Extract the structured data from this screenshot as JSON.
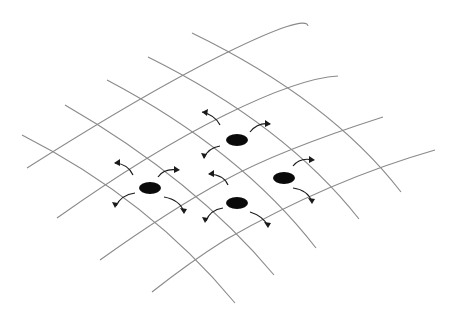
{
  "diagram": {
    "colors": {
      "background": "#ffffff",
      "grid": "#8a8a8a",
      "particle": "#0a0a0a",
      "arrow": "#1a1a1a"
    },
    "grid_rows": [
      {
        "d": "M27,168 Q150,90 228,52 T308,26"
      },
      {
        "d": "M57,218 Q150,152 225,115 T338,76"
      },
      {
        "d": "M100,260 Q170,210 225,180 T383,117"
      },
      {
        "d": "M152,292 Q190,262 225,240 Q330,180 435,150"
      }
    ],
    "grid_columns": [
      {
        "d": "M22,135 Q150,200 235,303"
      },
      {
        "d": "M65,105 Q195,180 274,275"
      },
      {
        "d": "M107,80 Q240,150 316,248"
      },
      {
        "d": "M148,57 Q285,125 359,219"
      },
      {
        "d": "M192,33 Q330,100 401,192"
      }
    ],
    "particles": [
      {
        "name": "particle-top",
        "cx": 237,
        "cy": 140,
        "rx": 11,
        "ry": 6
      },
      {
        "name": "particle-left",
        "cx": 150,
        "cy": 188,
        "rx": 11,
        "ry": 6
      },
      {
        "name": "particle-right",
        "cx": 284,
        "cy": 178,
        "rx": 11,
        "ry": 6
      },
      {
        "name": "particle-bottom",
        "cx": 237,
        "cy": 203,
        "rx": 11,
        "ry": 6
      }
    ],
    "arrows": [
      {
        "d": "M220,125 Q215,115 202,112",
        "head": "202,112 208,109 207,116"
      },
      {
        "d": "M250,132 Q258,122 270,124",
        "head": "271,124 265,120 265,127"
      },
      {
        "d": "M220,146 Q208,148 204,158",
        "head": "204,159 201,153 207,154"
      },
      {
        "d": "M133,175 Q128,164 115,163",
        "head": "114,163 120,159 120,166"
      },
      {
        "d": "M158,177 Q164,168 178,170",
        "head": "180,170 174,166 174,173"
      },
      {
        "d": "M135,193 Q121,195 116,206",
        "head": "115,208 112,202 118,203"
      },
      {
        "d": "M164,197 Q180,200 184,212",
        "head": "184,214 180,208 187,209"
      },
      {
        "d": "M228,185 Q224,175 209,174",
        "head": "208,174 214,170 214,177"
      },
      {
        "d": "M293,166 Q300,157 313,160",
        "head": "315,160 309,156 309,163"
      },
      {
        "d": "M293,188 Q308,190 312,202",
        "head": "312,204 308,198 315,199"
      },
      {
        "d": "M223,208 Q210,210 206,221",
        "head": "205,223 202,217 208,218"
      },
      {
        "d": "M250,212 Q263,216 268,226",
        "head": "268,228 264,222 271,223"
      }
    ]
  }
}
